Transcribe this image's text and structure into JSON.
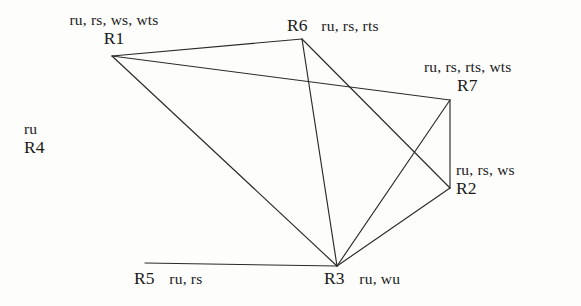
{
  "diagram": {
    "type": "undirected-graph",
    "background_color": "#fdfdfb",
    "edge_color": "#2a2a2a",
    "text_color": "#1a1a1a",
    "nodes": [
      {
        "id": "R1",
        "name": "R1",
        "attributes": "ru, rs, ws, wts",
        "x": 112,
        "y": 56,
        "label_layout": "stacked-above"
      },
      {
        "id": "R6",
        "name": "R6",
        "attributes": "ru, rs, rts",
        "x": 302,
        "y": 39,
        "label_layout": "inline-above"
      },
      {
        "id": "R7",
        "name": "R7",
        "attributes": "ru, rs, rts, wts",
        "x": 450,
        "y": 100,
        "label_layout": "stacked-above"
      },
      {
        "id": "R2",
        "name": "R2",
        "attributes": "ru, rs, ws",
        "x": 450,
        "y": 188,
        "label_layout": "stacked-right"
      },
      {
        "id": "R3",
        "name": "R3",
        "attributes": "ru, wu",
        "x": 337,
        "y": 266,
        "label_layout": "inline-below"
      },
      {
        "id": "R5",
        "name": "R5",
        "attributes": "ru, rs",
        "x": 145,
        "y": 263,
        "label_layout": "inline-below"
      },
      {
        "id": "R4",
        "name": "R4",
        "attributes": "ru",
        "x": 42,
        "y": 148,
        "label_layout": "stacked-isolated"
      }
    ],
    "edges": [
      {
        "from": "R1",
        "to": "R6"
      },
      {
        "from": "R1",
        "to": "R7"
      },
      {
        "from": "R1",
        "to": "R3"
      },
      {
        "from": "R6",
        "to": "R3"
      },
      {
        "from": "R6",
        "to": "R2"
      },
      {
        "from": "R7",
        "to": "R2"
      },
      {
        "from": "R7",
        "to": "R3"
      },
      {
        "from": "R2",
        "to": "R3"
      },
      {
        "from": "R5",
        "to": "R3"
      }
    ]
  }
}
